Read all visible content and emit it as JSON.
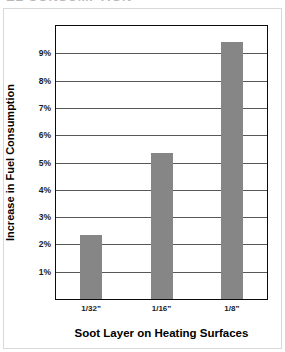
{
  "header": {
    "cropped_text": "EL CONSUMPTION"
  },
  "chart_data": {
    "type": "bar",
    "title": "",
    "categories": [
      "1/32”",
      "1/16”",
      "1/8”"
    ],
    "values": [
      2.35,
      5.35,
      9.4
    ],
    "xlabel": "Soot Layer on Heating Surfaces",
    "ylabel": "Increase in Fuel Consumption",
    "ylim": [
      0,
      10
    ],
    "ytick_labels": [
      "9%",
      "8%",
      "7%",
      "6%",
      "5%",
      "4%",
      "3%",
      "2%",
      "1%"
    ],
    "ytick_values": [
      9,
      8,
      7,
      6,
      5,
      4,
      3,
      2,
      1
    ],
    "grid": true,
    "legend": "none",
    "bar_color": "#868686",
    "axis_color": "#0b0b0b",
    "gridline_color": "#585858"
  }
}
